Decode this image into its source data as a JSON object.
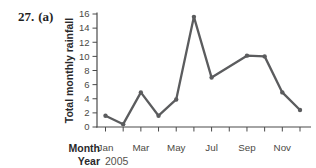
{
  "question": {
    "number": "27.",
    "part": "(a)"
  },
  "chart_data": {
    "type": "line",
    "title": "",
    "ylabel": "Total monthly rainfall",
    "xlabel": "Month",
    "year_label": "Year",
    "year": "2005",
    "x": [
      "Jan",
      "Feb",
      "Mar",
      "Apr",
      "May",
      "Jun",
      "Jul",
      "Aug",
      "Sep",
      "Oct",
      "Nov",
      "Dec"
    ],
    "x_tick_labels_shown": [
      "Jan",
      "Mar",
      "May",
      "Jul",
      "Sep",
      "Nov"
    ],
    "label_every": 2,
    "values": [
      1.6,
      0.4,
      4.9,
      1.6,
      3.9,
      15.6,
      7.0,
      null,
      10.1,
      10.0,
      4.9,
      2.4
    ],
    "ylim": [
      0,
      16
    ],
    "ytick_values": [
      0,
      2,
      4,
      6,
      8,
      10,
      12,
      14,
      16
    ],
    "grid": false,
    "legend": false,
    "marker": "circle",
    "line_color": "#5b5c5e",
    "axis_color": "#4a4a4a",
    "tick_label_color": "#4c4a45",
    "text_color": "#29292b"
  }
}
